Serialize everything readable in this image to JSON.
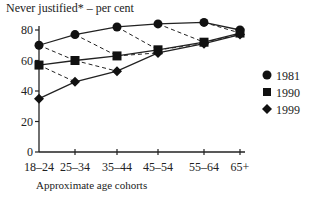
{
  "chart_data": {
    "type": "line",
    "title": "Never justified* – per cent",
    "xlabel": "Approximate age cohorts",
    "ylabel": "Never justified* – per cent",
    "categories": [
      "18–24",
      "25–34",
      "35–44",
      "45–54",
      "55–64",
      "65+"
    ],
    "yticks": [
      0,
      20,
      40,
      60,
      80
    ],
    "ylim": [
      0,
      85
    ],
    "grid": false,
    "legend_position": "right",
    "series": [
      {
        "name": "1981",
        "marker": "circle",
        "values": [
          70,
          77,
          82,
          84,
          85,
          80
        ]
      },
      {
        "name": "1990",
        "marker": "square",
        "values": [
          57,
          60,
          63,
          67,
          72,
          78
        ]
      },
      {
        "name": "1999",
        "marker": "diamond",
        "values": [
          35,
          46,
          53,
          65,
          71,
          77
        ]
      }
    ],
    "annotations": "Dashed lines connect the same birth cohort across survey years"
  },
  "legend": [
    {
      "label": "1981"
    },
    {
      "label": "1990"
    },
    {
      "label": "1999"
    }
  ]
}
